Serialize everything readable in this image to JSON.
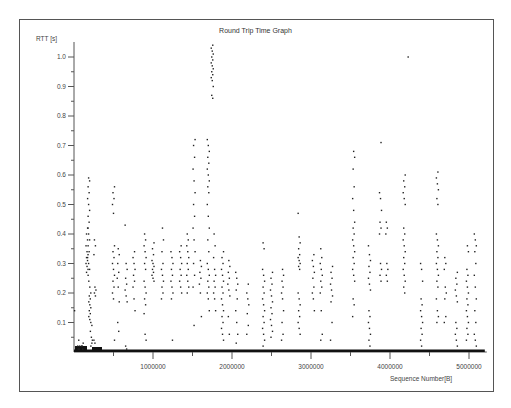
{
  "chart_data": {
    "type": "scatter",
    "title": "Round Trip Time Graph",
    "xlabel": "Sequence Number[B]",
    "ylabel": "RTT [s]",
    "xlim": [
      0,
      5200000
    ],
    "ylim": [
      0,
      1.05
    ],
    "grid": false,
    "legend": null,
    "x_ticks": [
      {
        "value": 1000000,
        "label": "1000000"
      },
      {
        "value": 2000000,
        "label": "2000000"
      },
      {
        "value": 3000000,
        "label": "3000000"
      },
      {
        "value": 4000000,
        "label": "4000000"
      },
      {
        "value": 5000000,
        "label": "5000000"
      }
    ],
    "x_minor_ticks": [
      500000,
      1500000,
      2500000,
      3500000,
      4500000
    ],
    "y_ticks": [
      {
        "value": 0.1,
        "label": "0.1"
      },
      {
        "value": 0.2,
        "label": "0.2"
      },
      {
        "value": 0.3,
        "label": "0.3"
      },
      {
        "value": 0.4,
        "label": "0.4"
      },
      {
        "value": 0.5,
        "label": "0.5"
      },
      {
        "value": 0.6,
        "label": "0.6"
      },
      {
        "value": 0.7,
        "label": "0.7"
      },
      {
        "value": 0.8,
        "label": "0.8"
      },
      {
        "value": 0.9,
        "label": "0.9"
      },
      {
        "value": 1.0,
        "label": "1.0"
      }
    ],
    "y_minor_ticks": [
      0.05,
      0.15,
      0.25,
      0.35,
      0.45,
      0.55,
      0.65,
      0.75,
      0.85,
      0.95
    ],
    "baseline_note": "dense band of near-zero RTT samples along entire x range",
    "series": [
      {
        "name": "RTT samples",
        "columns": [
          {
            "x": 20000,
            "rtt": [
              0.14
            ]
          },
          {
            "x": 60000,
            "rtt": [
              0.01,
              0.02,
              0.04,
              0.02,
              0.01
            ]
          },
          {
            "x": 110000,
            "rtt": [
              0.02,
              0.03,
              0.02,
              0.01
            ]
          },
          {
            "x": 165000,
            "rtt": [
              0.42,
              0.4,
              0.38,
              0.36,
              0.34,
              0.33,
              0.32,
              0.31,
              0.3,
              0.29,
              0.28,
              0.27
            ]
          },
          {
            "x": 185000,
            "rtt": [
              0.59,
              0.58,
              0.56,
              0.54,
              0.52,
              0.5,
              0.48,
              0.46,
              0.44,
              0.42,
              0.4,
              0.38,
              0.36,
              0.34,
              0.32,
              0.3,
              0.28,
              0.26
            ]
          },
          {
            "x": 200000,
            "rtt": [
              0.24,
              0.22,
              0.2,
              0.19,
              0.18,
              0.17,
              0.16,
              0.15,
              0.14,
              0.13,
              0.12,
              0.11,
              0.1
            ]
          },
          {
            "x": 220000,
            "rtt": [
              0.09,
              0.07,
              0.05,
              0.04,
              0.02,
              0.03
            ]
          },
          {
            "x": 265000,
            "rtt": [
              0.38,
              0.36,
              0.33,
              0.22,
              0.21,
              0.2,
              0.19,
              0.04,
              0.03
            ]
          },
          {
            "x": 500000,
            "rtt": [
              0.56,
              0.54,
              0.52,
              0.5,
              0.47,
              0.36,
              0.34,
              0.32,
              0.3,
              0.28,
              0.26,
              0.24,
              0.22,
              0.2,
              0.18,
              0.04
            ]
          },
          {
            "x": 560000,
            "rtt": [
              0.35,
              0.33,
              0.3,
              0.27,
              0.25,
              0.22,
              0.17,
              0.1,
              0.07
            ]
          },
          {
            "x": 660000,
            "rtt": [
              0.43,
              0.3,
              0.28,
              0.25,
              0.23,
              0.21,
              0.19,
              0.17,
              0.02,
              0.01
            ]
          },
          {
            "x": 760000,
            "rtt": [
              0.34,
              0.32,
              0.3,
              0.28,
              0.26,
              0.24,
              0.22,
              0.18,
              0.14
            ]
          },
          {
            "x": 900000,
            "rtt": [
              0.4,
              0.38,
              0.36,
              0.34,
              0.32,
              0.3,
              0.28,
              0.24,
              0.22,
              0.2,
              0.18,
              0.16,
              0.13,
              0.06,
              0.04
            ]
          },
          {
            "x": 1000000,
            "rtt": [
              0.37,
              0.35,
              0.33,
              0.31,
              0.3,
              0.29,
              0.28,
              0.27,
              0.26,
              0.25,
              0.24
            ]
          },
          {
            "x": 1120000,
            "rtt": [
              0.42,
              0.38,
              0.34,
              0.3,
              0.28,
              0.26,
              0.24,
              0.22,
              0.2,
              0.18
            ]
          },
          {
            "x": 1240000,
            "rtt": [
              0.34,
              0.32,
              0.3,
              0.28,
              0.26,
              0.24,
              0.22,
              0.2,
              0.18,
              0.04
            ]
          },
          {
            "x": 1350000,
            "rtt": [
              0.36,
              0.34,
              0.32,
              0.3,
              0.28,
              0.26,
              0.24,
              0.22,
              0.2
            ]
          },
          {
            "x": 1440000,
            "rtt": [
              0.4,
              0.38,
              0.36,
              0.34,
              0.32,
              0.3,
              0.28,
              0.26,
              0.24,
              0.22,
              0.2
            ]
          },
          {
            "x": 1520000,
            "rtt": [
              0.72,
              0.7,
              0.66,
              0.62,
              0.58,
              0.54,
              0.5,
              0.46,
              0.42,
              0.38,
              0.34,
              0.3,
              0.26,
              0.22,
              0.09
            ]
          },
          {
            "x": 1600000,
            "rtt": [
              0.31,
              0.29,
              0.27,
              0.25,
              0.23,
              0.2,
              0.12
            ]
          },
          {
            "x": 1700000,
            "rtt": [
              0.72,
              0.7,
              0.68,
              0.66,
              0.64,
              0.62,
              0.6,
              0.58,
              0.56,
              0.54,
              0.5,
              0.46,
              0.42,
              0.38,
              0.34,
              0.3,
              0.28,
              0.26,
              0.24,
              0.22,
              0.2,
              0.18,
              0.14
            ]
          },
          {
            "x": 1750000,
            "rtt": [
              1.04,
              1.03,
              1.02,
              1.01,
              1.0,
              0.99,
              0.98,
              0.97,
              0.96,
              0.95,
              0.94,
              0.93,
              0.92,
              0.9,
              0.87,
              0.86
            ]
          },
          {
            "x": 1780000,
            "rtt": [
              0.4,
              0.36,
              0.32,
              0.28,
              0.26,
              0.24,
              0.22,
              0.2,
              0.18,
              0.14
            ]
          },
          {
            "x": 1880000,
            "rtt": [
              0.34,
              0.32,
              0.3,
              0.28,
              0.26,
              0.24,
              0.22,
              0.2,
              0.18,
              0.16,
              0.14,
              0.12,
              0.1,
              0.08,
              0.06,
              0.04
            ]
          },
          {
            "x": 1960000,
            "rtt": [
              0.31,
              0.29,
              0.27,
              0.25,
              0.23,
              0.21,
              0.19,
              0.12,
              0.06
            ]
          },
          {
            "x": 2060000,
            "rtt": [
              0.27,
              0.25,
              0.23,
              0.21,
              0.18,
              0.14,
              0.1,
              0.06,
              0.03
            ]
          },
          {
            "x": 2200000,
            "rtt": [
              0.23,
              0.2,
              0.18,
              0.16,
              0.13,
              0.09,
              0.06
            ]
          },
          {
            "x": 2400000,
            "rtt": [
              0.37,
              0.35,
              0.28,
              0.26,
              0.24,
              0.22,
              0.2,
              0.18,
              0.16,
              0.14,
              0.12,
              0.1,
              0.08,
              0.06,
              0.04,
              0.02
            ]
          },
          {
            "x": 2500000,
            "rtt": [
              0.27,
              0.25,
              0.23,
              0.21,
              0.19,
              0.17,
              0.15,
              0.13,
              0.11,
              0.09,
              0.07,
              0.05
            ]
          },
          {
            "x": 2640000,
            "rtt": [
              0.28,
              0.26,
              0.24,
              0.22,
              0.2,
              0.18,
              0.14,
              0.1,
              0.06,
              0.04
            ]
          },
          {
            "x": 2850000,
            "rtt": [
              0.47,
              0.39,
              0.37,
              0.35,
              0.33,
              0.32,
              0.31,
              0.3,
              0.29,
              0.28,
              0.2,
              0.18,
              0.16,
              0.14,
              0.12,
              0.1,
              0.08,
              0.06
            ]
          },
          {
            "x": 3030000,
            "rtt": [
              0.33,
              0.31,
              0.29,
              0.27,
              0.25,
              0.22,
              0.2,
              0.18,
              0.14
            ]
          },
          {
            "x": 3130000,
            "rtt": [
              0.35,
              0.32,
              0.3,
              0.28,
              0.26,
              0.24,
              0.22,
              0.2,
              0.14,
              0.06,
              0.04
            ]
          },
          {
            "x": 3260000,
            "rtt": [
              0.29,
              0.27,
              0.25,
              0.23,
              0.21,
              0.19,
              0.17,
              0.1,
              0.04
            ]
          },
          {
            "x": 3540000,
            "rtt": [
              0.68,
              0.66,
              0.62,
              0.56,
              0.52,
              0.48,
              0.44,
              0.42,
              0.4,
              0.38,
              0.36,
              0.34,
              0.32,
              0.3,
              0.28,
              0.26,
              0.24,
              0.18,
              0.16,
              0.12
            ]
          },
          {
            "x": 3740000,
            "rtt": [
              0.36,
              0.33,
              0.31,
              0.29,
              0.27,
              0.25,
              0.23,
              0.21,
              0.14,
              0.12,
              0.1,
              0.08,
              0.06,
              0.04,
              0.02
            ]
          },
          {
            "x": 3880000,
            "rtt": [
              0.71,
              0.54,
              0.52,
              0.48,
              0.44,
              0.42,
              0.4,
              0.3,
              0.28,
              0.26,
              0.24
            ]
          },
          {
            "x": 3960000,
            "rtt": [
              0.44,
              0.42,
              0.4,
              0.3,
              0.28,
              0.26,
              0.24
            ]
          },
          {
            "x": 4180000,
            "rtt": [
              0.6,
              0.58,
              0.56,
              0.54,
              0.52,
              0.5,
              0.42,
              0.4,
              0.38,
              0.36,
              0.34,
              0.32,
              0.3,
              0.28,
              0.26,
              0.24,
              0.22,
              0.2
            ]
          },
          {
            "x": 4230000,
            "rtt": [
              1.0
            ]
          },
          {
            "x": 4400000,
            "rtt": [
              0.3,
              0.28,
              0.24,
              0.18,
              0.16,
              0.14,
              0.12,
              0.1,
              0.08,
              0.06,
              0.04,
              0.02
            ]
          },
          {
            "x": 4600000,
            "rtt": [
              0.61,
              0.59,
              0.57,
              0.55,
              0.52,
              0.5,
              0.4,
              0.38,
              0.36,
              0.34,
              0.32,
              0.3,
              0.28,
              0.26,
              0.24,
              0.22,
              0.18,
              0.14,
              0.12,
              0.1
            ]
          },
          {
            "x": 4700000,
            "rtt": [
              0.32,
              0.3,
              0.28,
              0.22,
              0.2,
              0.18,
              0.12,
              0.1
            ]
          },
          {
            "x": 4840000,
            "rtt": [
              0.27,
              0.25,
              0.23,
              0.21,
              0.19,
              0.17,
              0.1,
              0.08,
              0.06,
              0.04,
              0.02
            ]
          },
          {
            "x": 4980000,
            "rtt": [
              0.36,
              0.34,
              0.28,
              0.26,
              0.24,
              0.22,
              0.2,
              0.18,
              0.16,
              0.14,
              0.12,
              0.1,
              0.08,
              0.06,
              0.04
            ]
          },
          {
            "x": 5080000,
            "rtt": [
              0.4,
              0.38,
              0.36,
              0.34,
              0.3,
              0.26,
              0.22,
              0.18,
              0.14,
              0.1,
              0.06,
              0.04,
              0.02
            ]
          }
        ]
      }
    ]
  }
}
